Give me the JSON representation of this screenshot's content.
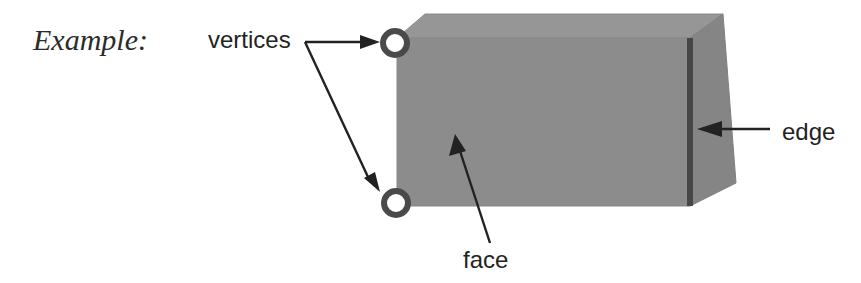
{
  "figure": {
    "kind": "geometry-solid-annotated-diagram",
    "caption_label": "Example:",
    "background_color": "#ffffff"
  },
  "labels": {
    "example": "Example:",
    "vertices": "vertices",
    "face": "face",
    "edge": "edge"
  },
  "solid": {
    "name": "rectangular-prism",
    "front_face_color": "#8c8c8c",
    "top_face_color": "#969696",
    "right_face_color": "#858585",
    "edge_highlight_color": "#474747",
    "outline_color": "#6e6e6e",
    "geometry": {
      "front_face": "397,38 690,38 690,206 397,206",
      "top_face": "397,38 425,14 723,14 690,38",
      "right_face": "690,38 723,14 736,183 690,206",
      "highlight_edge": {
        "x1": 691,
        "y1": 38,
        "x2": 691,
        "y2": 206
      }
    }
  },
  "annotations": [
    {
      "id": "vertices",
      "text": "vertices",
      "text_x": 208,
      "text_y": 48,
      "targets": [
        "front-top-left-corner",
        "front-bottom-left-corner"
      ]
    },
    {
      "id": "face",
      "text": "face",
      "text_x": 463,
      "text_y": 268,
      "targets": [
        "front-face"
      ]
    },
    {
      "id": "edge",
      "text": "edge",
      "text_x": 782,
      "text_y": 140,
      "targets": [
        "vertical-right-edge"
      ]
    }
  ],
  "vertex_markers": [
    {
      "id": "vertex-top",
      "cx": 395,
      "cy": 43,
      "r": 15
    },
    {
      "id": "vertex-bottom",
      "cx": 396,
      "cy": 203,
      "r": 15
    }
  ]
}
